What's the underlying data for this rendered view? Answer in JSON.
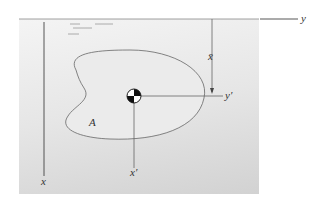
{
  "figure": {
    "type": "submerged plane area diagram",
    "labels": {
      "surface_axis": "y",
      "depth_axis": "x",
      "centroid_axis_horizontal": "y′",
      "centroid_axis_vertical": "x′",
      "centroid_depth": "x̄",
      "area": "A"
    },
    "colors": {
      "background": "#ffffff",
      "fluid_top": "#f4f4f4",
      "fluid_bottom": "#d2d2d2",
      "lines": "#555555",
      "area_fill": "#e8e8e8"
    }
  }
}
